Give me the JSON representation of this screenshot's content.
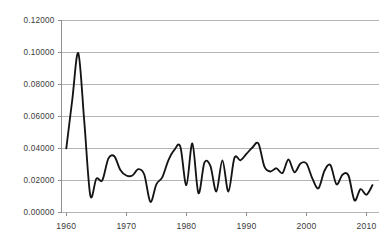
{
  "chart_data": {
    "type": "line",
    "title": "",
    "subtitle": "",
    "xlabel": "",
    "ylabel": "",
    "xlim": [
      1959.2,
      2012.0
    ],
    "ylim": [
      0.0,
      0.12
    ],
    "grid": true,
    "legend": null,
    "legend_position": "none",
    "annotations": [],
    "line_color": "#141414",
    "gridline_color": "#b4b4b4",
    "axis_color": "#8f8f8f",
    "label_color": "#3b3b3b",
    "background_color": "#ffffff",
    "y_ticks": [
      0.0,
      0.02,
      0.04,
      0.06,
      0.08,
      0.1,
      0.12
    ],
    "y_tick_labels": [
      "0.00000",
      "0.02000",
      "0.04000",
      "0.06000",
      "0.08000",
      "0.10000",
      "0.12000"
    ],
    "x_ticks": [
      1960,
      1970,
      1980,
      1990,
      2000,
      2010
    ],
    "x_tick_labels": [
      "1960",
      "1970",
      "1980",
      "1990",
      "2000",
      "2010"
    ],
    "series": [
      {
        "name": "series-1",
        "x": [
          1960,
          1961,
          1962,
          1963,
          1964,
          1965,
          1966,
          1967,
          1968,
          1969,
          1970,
          1971,
          1972,
          1973,
          1974,
          1975,
          1976,
          1977,
          1978,
          1979,
          1980,
          1981,
          1982,
          1983,
          1984,
          1985,
          1986,
          1987,
          1988,
          1989,
          1990,
          1991,
          1992,
          1993,
          1994,
          1995,
          1996,
          1997,
          1998,
          1999,
          2000,
          2001,
          2002,
          2003,
          2004,
          2005,
          2006,
          2007,
          2008,
          2009,
          2010,
          2011
        ],
        "values": [
          0.0395,
          0.07,
          0.099,
          0.056,
          0.01,
          0.0205,
          0.0195,
          0.033,
          0.0345,
          0.026,
          0.0225,
          0.0225,
          0.0265,
          0.023,
          0.006,
          0.017,
          0.0215,
          0.032,
          0.0385,
          0.0405,
          0.0165,
          0.0425,
          0.0115,
          0.0305,
          0.0285,
          0.0125,
          0.032,
          0.0125,
          0.0335,
          0.032,
          0.036,
          0.04,
          0.0425,
          0.028,
          0.025,
          0.027,
          0.024,
          0.0325,
          0.0245,
          0.03,
          0.03,
          0.0205,
          0.0145,
          0.0255,
          0.029,
          0.017,
          0.023,
          0.0225,
          0.007,
          0.014,
          0.0105,
          0.0165
        ]
      }
    ]
  },
  "accessibility": {
    "chart_description": "Line chart of an annual series from 1960 to 2011 with a sharp peak near 0.099 in 1962 and declining oscillations thereafter"
  }
}
